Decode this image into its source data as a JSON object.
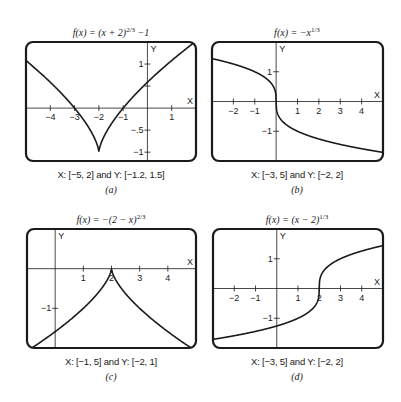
{
  "chart_data": [
    {
      "id": "a",
      "type": "line",
      "title": "f(x) = (x + 2)^(2/3) − 1",
      "title_parts": {
        "base": "f(x) = (x + 2)",
        "exp": "2/3",
        "tail": "  −1"
      },
      "function": "(x+2)^(2/3) - 1",
      "xlabel": "X",
      "ylabel": "Y",
      "xlim": [
        -5,
        2
      ],
      "ylim": [
        -1.2,
        1.5
      ],
      "x_ticks": [
        -4,
        -3,
        -2,
        -1,
        1
      ],
      "x_tick_labels": [
        "−4",
        "−3",
        "−2",
        "−1",
        "1"
      ],
      "y_ticks": [
        -1,
        -0.5,
        0.5,
        1
      ],
      "y_tick_labels": [
        "−1",
        "−.5",
        "",
        "1"
      ],
      "window_caption": "X: [−5, 2] and Y: [−1.2, 1.5]",
      "sublabel": "(a)",
      "box": {
        "x": 26,
        "y": 42,
        "w": 170,
        "h": 119
      },
      "title_pos": {
        "x": 111,
        "y": 26
      },
      "caption_pos": {
        "x": 111,
        "y": 169
      },
      "sub_pos": {
        "x": 111,
        "y": 184
      }
    },
    {
      "id": "b",
      "type": "line",
      "title": "f(x) = −x^(1/3)",
      "title_parts": {
        "base": "f(x) = −x",
        "exp": "1/3",
        "tail": ""
      },
      "function": "-x^(1/3)",
      "xlabel": "X",
      "ylabel": "Y",
      "xlim": [
        -3,
        5
      ],
      "ylim": [
        -2,
        2
      ],
      "x_ticks": [
        -2,
        -1,
        1,
        2,
        3,
        4
      ],
      "x_tick_labels": [
        "−2",
        "−1",
        "1",
        "2",
        "3",
        "4"
      ],
      "y_ticks": [
        -1,
        1
      ],
      "y_tick_labels": [
        "−1",
        "1"
      ],
      "window_caption": "X: [−3, 5] and Y: [−2, 2]",
      "sublabel": "(b)",
      "box": {
        "x": 212,
        "y": 42,
        "w": 171,
        "h": 119
      },
      "title_pos": {
        "x": 297,
        "y": 26
      },
      "caption_pos": {
        "x": 297,
        "y": 169
      },
      "sub_pos": {
        "x": 297,
        "y": 184
      }
    },
    {
      "id": "c",
      "type": "line",
      "title": "f(x) = −(2 − x)^(2/3)",
      "title_parts": {
        "base": "f(x) = −(2 − x)",
        "exp": "2/3",
        "tail": ""
      },
      "function": "-(2-x)^(2/3)",
      "xlabel": "X",
      "ylabel": "Y",
      "xlim": [
        -1,
        5
      ],
      "ylim": [
        -2,
        1
      ],
      "x_ticks": [
        1,
        2,
        3,
        4
      ],
      "x_tick_labels": [
        "1",
        "2",
        "3",
        "4"
      ],
      "y_ticks": [
        -1
      ],
      "y_tick_labels": [
        "−1"
      ],
      "window_caption": "X: [−1, 5] and Y: [−2, 1]",
      "sublabel": "(c)",
      "box": {
        "x": 27,
        "y": 229,
        "w": 169,
        "h": 119
      },
      "title_pos": {
        "x": 111,
        "y": 213
      },
      "caption_pos": {
        "x": 111,
        "y": 356
      },
      "sub_pos": {
        "x": 111,
        "y": 371
      }
    },
    {
      "id": "d",
      "type": "line",
      "title": "f(x) = (x − 2)^(1/3)",
      "title_parts": {
        "base": "f(x) = (x − 2)",
        "exp": "1/3",
        "tail": ""
      },
      "function": "(x-2)^(1/3)",
      "xlabel": "X",
      "ylabel": "Y",
      "xlim": [
        -3,
        5
      ],
      "ylim": [
        -2,
        2
      ],
      "x_ticks": [
        -2,
        -1,
        1,
        2,
        3,
        4
      ],
      "x_tick_labels": [
        "−2",
        "−1",
        "1",
        "2",
        "3",
        "4"
      ],
      "y_ticks": [
        -1,
        1
      ],
      "y_tick_labels": [
        "−1",
        "1"
      ],
      "window_caption": "X: [−3, 5] and Y: [−2, 2]",
      "sublabel": "(d)",
      "box": {
        "x": 213,
        "y": 229,
        "w": 170,
        "h": 119
      },
      "title_pos": {
        "x": 297,
        "y": 213
      },
      "caption_pos": {
        "x": 297,
        "y": 356
      },
      "sub_pos": {
        "x": 297,
        "y": 371
      }
    }
  ],
  "colors": {
    "curve": "#1a1a1a",
    "frame": "#1a1a1a",
    "background": "#ffffff"
  }
}
